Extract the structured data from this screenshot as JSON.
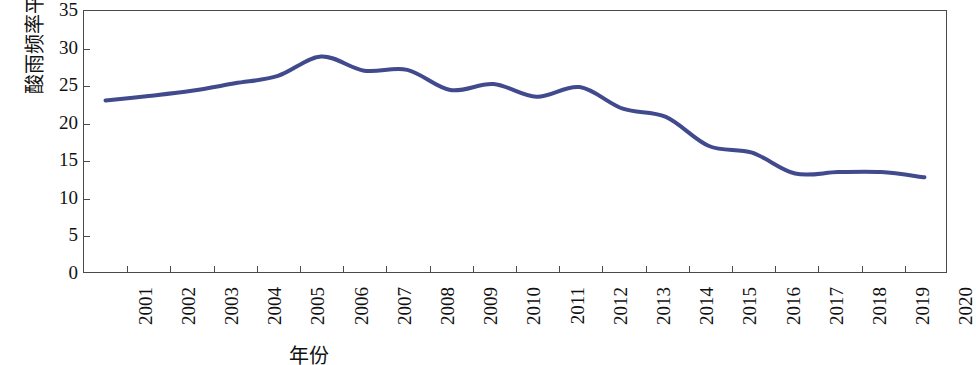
{
  "chart_data": {
    "type": "line",
    "title": "",
    "xlabel": "年份",
    "ylabel": "酸雨频率平均值/%",
    "categories": [
      "2001",
      "2002",
      "2003",
      "2004",
      "2005",
      "2006",
      "2007",
      "2008",
      "2009",
      "2010",
      "2011",
      "2012",
      "2013",
      "2014",
      "2015",
      "2016",
      "2017",
      "2018",
      "2019",
      "2020"
    ],
    "values": [
      23.0,
      23.6,
      24.3,
      25.3,
      26.3,
      28.9,
      27.0,
      27.1,
      24.4,
      25.2,
      23.5,
      24.8,
      21.9,
      20.8,
      16.9,
      16.0,
      13.2,
      13.4,
      13.4,
      12.7
    ],
    "series": [
      {
        "name": "酸雨频率平均值",
        "values": [
          23.0,
          23.6,
          24.3,
          25.3,
          26.3,
          28.9,
          27.0,
          27.1,
          24.4,
          25.2,
          23.5,
          24.8,
          21.9,
          20.8,
          16.9,
          16.0,
          13.2,
          13.4,
          13.4,
          12.7
        ],
        "color": "#414a8c"
      }
    ],
    "ylim": [
      0,
      35
    ],
    "y_ticks": [
      "0",
      "5",
      "10",
      "15",
      "20",
      "25",
      "30",
      "35"
    ],
    "y_tick_values": [
      0,
      5,
      10,
      15,
      20,
      25,
      30,
      35
    ],
    "grid": false,
    "legend": false,
    "legend_position": "none",
    "line_color": "#414a8c",
    "line_width": 4,
    "axis_color": "#4a4a4a",
    "background": "#ffffff"
  },
  "axes": {
    "y_title": "酸雨频率平均值/%",
    "x_title": "年份"
  }
}
